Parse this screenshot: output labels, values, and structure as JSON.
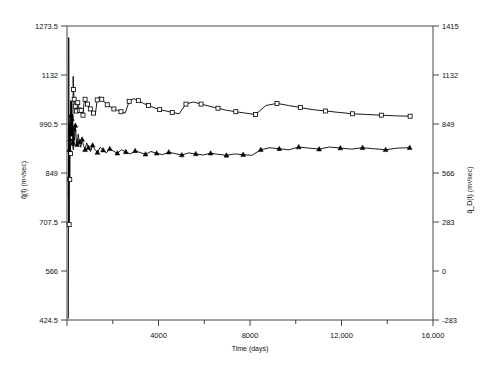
{
  "chart_data": {
    "type": "line",
    "title": "",
    "xlabel": "Time (days)",
    "ylabel": "q̃(t) (m³/sec)",
    "y2label": "q̃_D(t) (m³/sec)",
    "xlim": [
      0,
      16000
    ],
    "ylim": [
      424.5,
      1273.5
    ],
    "y2lim": [
      -283,
      1415
    ],
    "grid": false,
    "legend": "none",
    "xticks": [
      0,
      4000,
      8000,
      12000,
      16000
    ],
    "xtick_labels": [
      "",
      "4000",
      "8000",
      "12,000",
      "16,000"
    ],
    "xminor_ticks": [
      2000,
      6000,
      10000,
      14000
    ],
    "yticks": [
      424.5,
      566,
      707.5,
      849,
      990.5,
      1132,
      1273.5
    ],
    "ytick_labels": [
      "424.5",
      "566",
      "707.5",
      "849",
      "990.5",
      "1132",
      "1273.5"
    ],
    "y2ticks": [
      -283,
      0,
      283,
      566,
      849,
      1132,
      1415
    ],
    "y2tick_labels": [
      "-283",
      "0",
      "283",
      "566",
      "849",
      "1132",
      "1415"
    ],
    "series": [
      {
        "name": "q̃(t)",
        "marker": "open-square",
        "color": "#000000",
        "axis": "left",
        "points": [
          [
            60,
            430
          ],
          [
            75,
            1240
          ],
          [
            95,
            700
          ],
          [
            110,
            990
          ],
          [
            120,
            830
          ],
          [
            135,
            960
          ],
          [
            150,
            905
          ],
          [
            160,
            1010
          ],
          [
            170,
            940
          ],
          [
            180,
            1030
          ],
          [
            195,
            950
          ],
          [
            210,
            1020
          ],
          [
            225,
            935
          ],
          [
            240,
            1000
          ],
          [
            255,
            940
          ],
          [
            270,
            1128
          ],
          [
            285,
            1090
          ],
          [
            300,
            1075
          ],
          [
            315,
            1062
          ],
          [
            340,
            1050
          ],
          [
            360,
            1042
          ],
          [
            385,
            1035
          ],
          [
            410,
            1028
          ],
          [
            440,
            1045
          ],
          [
            470,
            1052
          ],
          [
            500,
            1044
          ],
          [
            540,
            1030
          ],
          [
            580,
            1038
          ],
          [
            620,
            1030
          ],
          [
            660,
            1022
          ],
          [
            700,
            1016
          ],
          [
            740,
            1050
          ],
          [
            790,
            1062
          ],
          [
            840,
            1056
          ],
          [
            900,
            1048
          ],
          [
            960,
            1040
          ],
          [
            1020,
            1034
          ],
          [
            1090,
            1028
          ],
          [
            1160,
            1022
          ],
          [
            1240,
            1018
          ],
          [
            1320,
            1060
          ],
          [
            1420,
            1070
          ],
          [
            1520,
            1062
          ],
          [
            1640,
            1054
          ],
          [
            1760,
            1046
          ],
          [
            1900,
            1040
          ],
          [
            2050,
            1034
          ],
          [
            2200,
            1030
          ],
          [
            2360,
            1026
          ],
          [
            2540,
            1022
          ],
          [
            2720,
            1056
          ],
          [
            2920,
            1064
          ],
          [
            3120,
            1058
          ],
          [
            3340,
            1050
          ],
          [
            3560,
            1044
          ],
          [
            3800,
            1038
          ],
          [
            4050,
            1032
          ],
          [
            4320,
            1028
          ],
          [
            4600,
            1024
          ],
          [
            4900,
            1020
          ],
          [
            5200,
            1048
          ],
          [
            5520,
            1054
          ],
          [
            5860,
            1048
          ],
          [
            6220,
            1042
          ],
          [
            6600,
            1036
          ],
          [
            6980,
            1030
          ],
          [
            7380,
            1026
          ],
          [
            7800,
            1022
          ],
          [
            8240,
            1018
          ],
          [
            8700,
            1044
          ],
          [
            9180,
            1050
          ],
          [
            9680,
            1044
          ],
          [
            10200,
            1038
          ],
          [
            10740,
            1032
          ],
          [
            11300,
            1028
          ],
          [
            11880,
            1024
          ],
          [
            12480,
            1020
          ],
          [
            13100,
            1018
          ],
          [
            13740,
            1016
          ],
          [
            14400,
            1014
          ],
          [
            15000,
            1013
          ]
        ]
      },
      {
        "name": "q̃_D(t)",
        "marker": "filled-triangle",
        "color": "#000000",
        "axis": "right",
        "points": [
          [
            60,
            424.5
          ],
          [
            80,
            860
          ],
          [
            100,
            700
          ],
          [
            115,
            830
          ],
          [
            128,
            760
          ],
          [
            140,
            900
          ],
          [
            152,
            820
          ],
          [
            165,
            985
          ],
          [
            180,
            900
          ],
          [
            195,
            980
          ],
          [
            212,
            880
          ],
          [
            230,
            810
          ],
          [
            250,
            740
          ],
          [
            275,
            700
          ],
          [
            300,
            820
          ],
          [
            330,
            760
          ],
          [
            365,
            840
          ],
          [
            400,
            770
          ],
          [
            440,
            730
          ],
          [
            490,
            790
          ],
          [
            540,
            745
          ],
          [
            600,
            715
          ],
          [
            660,
            760
          ],
          [
            720,
            725
          ],
          [
            790,
            700
          ],
          [
            860,
            740
          ],
          [
            940,
            712
          ],
          [
            1030,
            690
          ],
          [
            1120,
            726
          ],
          [
            1220,
            702
          ],
          [
            1330,
            684
          ],
          [
            1450,
            714
          ],
          [
            1580,
            698
          ],
          [
            1720,
            682
          ],
          [
            1870,
            706
          ],
          [
            2030,
            692
          ],
          [
            2200,
            680
          ],
          [
            2380,
            700
          ],
          [
            2570,
            688
          ],
          [
            2770,
            676
          ],
          [
            2980,
            694
          ],
          [
            3200,
            684
          ],
          [
            3430,
            674
          ],
          [
            3670,
            690
          ],
          [
            3920,
            680
          ],
          [
            4180,
            672
          ],
          [
            4450,
            686
          ],
          [
            4730,
            678
          ],
          [
            5020,
            670
          ],
          [
            5320,
            682
          ],
          [
            5630,
            676
          ],
          [
            5950,
            670
          ],
          [
            6280,
            680
          ],
          [
            6620,
            674
          ],
          [
            6970,
            668
          ],
          [
            7330,
            676
          ],
          [
            7700,
            672
          ],
          [
            8080,
            668
          ],
          [
            8470,
            700
          ],
          [
            8870,
            712
          ],
          [
            9280,
            706
          ],
          [
            9700,
            700
          ],
          [
            10130,
            716
          ],
          [
            10570,
            710
          ],
          [
            11020,
            704
          ],
          [
            11480,
            716
          ],
          [
            11950,
            710
          ],
          [
            12430,
            704
          ],
          [
            12920,
            712
          ],
          [
            13420,
            706
          ],
          [
            13930,
            700
          ],
          [
            14450,
            710
          ],
          [
            14980,
            712
          ]
        ]
      }
    ]
  }
}
